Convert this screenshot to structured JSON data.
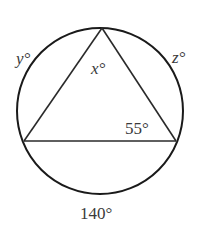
{
  "diagram": {
    "type": "inscribed-triangle-in-circle",
    "circle": {
      "cx": 100,
      "cy": 111,
      "r": 83,
      "stroke": "#1a1a1a"
    },
    "vertices": {
      "top": {
        "x": 102,
        "y": 28
      },
      "left": {
        "x": 24,
        "y": 141
      },
      "right": {
        "x": 176,
        "y": 141
      }
    },
    "labels": {
      "y_arc": "y°",
      "z_arc": "z°",
      "x_angle": "x°",
      "angle_right": "55°",
      "bottom_arc": "140°"
    },
    "colors": {
      "line": "#2a2a2a",
      "text": "#3a3a3a",
      "background": "#ffffff"
    }
  }
}
